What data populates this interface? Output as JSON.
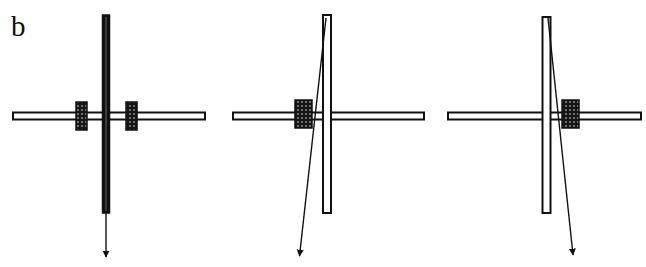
{
  "figure": {
    "panel_label": "b",
    "background": "#ffffff",
    "stroke_color": "#111111",
    "panels": [
      {
        "id": "centered",
        "description": "Vertical bar (solid/dark) centered on horizontal bar with two symmetric spring boxes; force arrow straight down",
        "horizontal_bar": {
          "x1": 13,
          "x2": 205,
          "y": 116
        },
        "vertical_bar": {
          "x": 106,
          "y1": 15,
          "y2": 213,
          "filled": true
        },
        "boxes": [
          {
            "x": 76,
            "y": 102,
            "w": 11,
            "h": 28
          },
          {
            "x": 126,
            "y": 102,
            "w": 11,
            "h": 28
          }
        ],
        "arrow": {
          "x1": 106,
          "y1": 213,
          "x2": 106,
          "y2": 258
        }
      },
      {
        "id": "left-shifted",
        "description": "Hollow vertical bar, single spring box left of center; arrow slanting down-left from top",
        "horizontal_bar": {
          "x1": 233,
          "x2": 424,
          "y": 116
        },
        "vertical_bar": {
          "x": 327,
          "y1": 15,
          "y2": 213,
          "filled": false
        },
        "boxes": [
          {
            "x": 295,
            "y": 100,
            "w": 17,
            "h": 28
          }
        ],
        "arrow": {
          "x1": 326,
          "y1": 18,
          "x2": 299,
          "y2": 257
        }
      },
      {
        "id": "right-shifted",
        "description": "Hollow vertical bar, single spring box right of center; arrow slanting down-right from top",
        "horizontal_bar": {
          "x1": 448,
          "x2": 641,
          "y": 116
        },
        "vertical_bar": {
          "x": 546,
          "y1": 17,
          "y2": 213,
          "filled": false
        },
        "boxes": [
          {
            "x": 562,
            "y": 100,
            "w": 17,
            "h": 28
          }
        ],
        "arrow": {
          "x1": 548,
          "y1": 18,
          "x2": 573,
          "y2": 256
        }
      }
    ]
  }
}
